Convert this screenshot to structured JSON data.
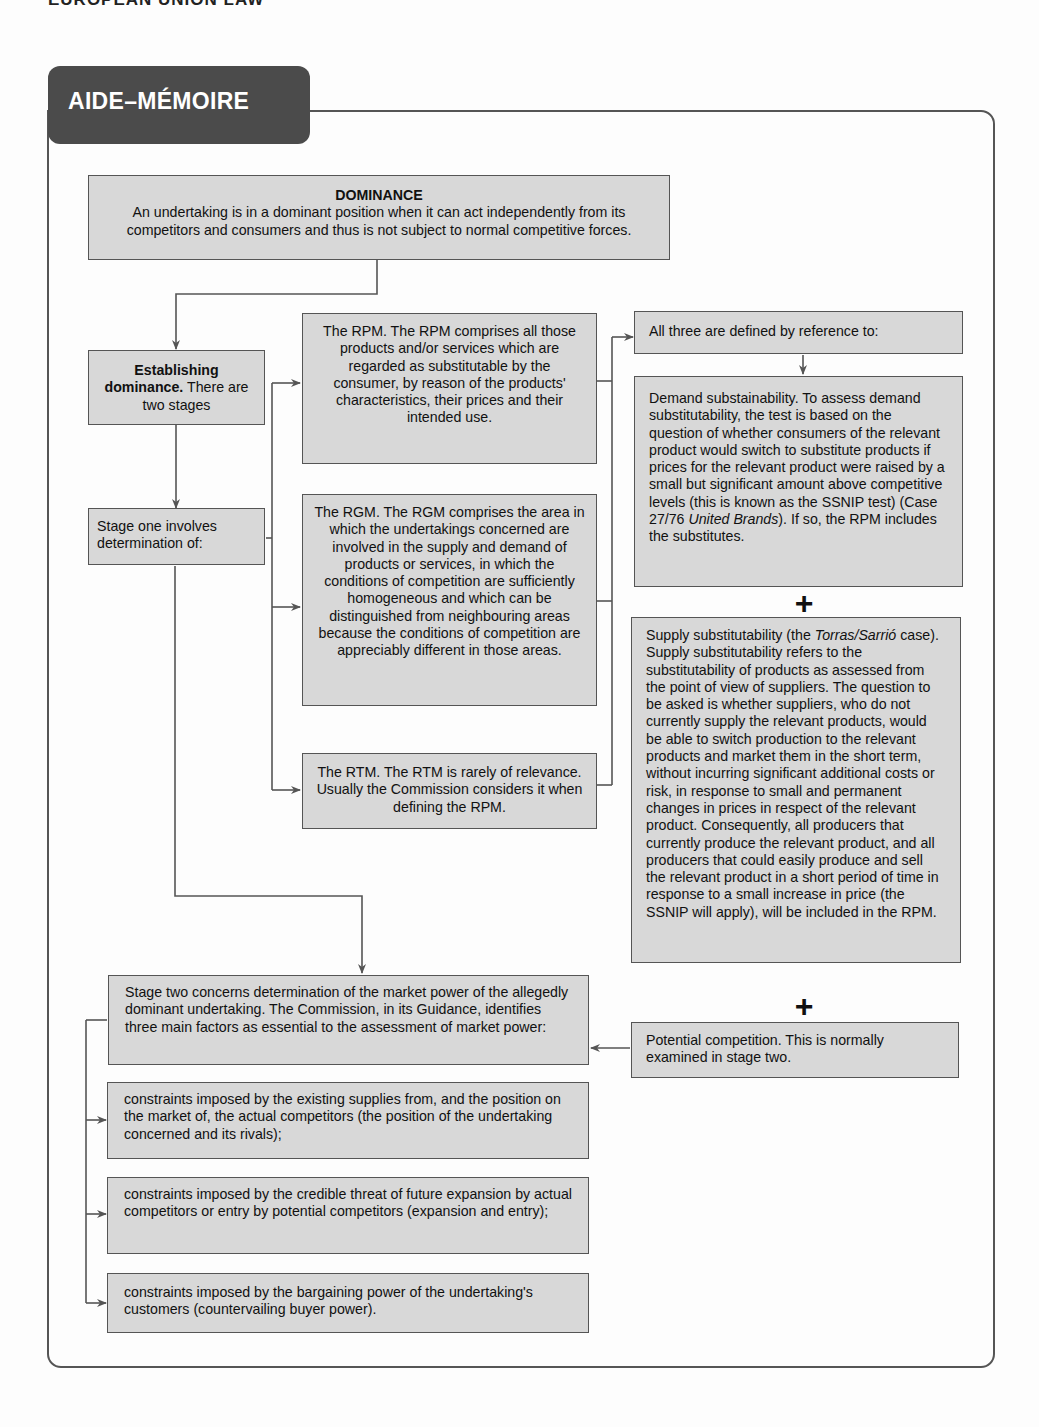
{
  "running_head": "EUROPEAN UNION LAW",
  "header": {
    "title": "AIDE–MÉMOIRE"
  },
  "dominance": {
    "title": "DOMINANCE",
    "text": "An undertaking is in a dominant position when it can act independently from its competitors and consumers and thus is not subject to normal competitive forces."
  },
  "establishing": {
    "bold": "Establishing dominance.",
    "text": " There are two stages"
  },
  "stage_one": {
    "text": "Stage one involves determination of:"
  },
  "rpm": {
    "text": "The RPM. The RPM comprises all those products and/or services which are regarded as substitutable by the consumer, by reason of the products' characteristics, their prices and their intended use."
  },
  "rgm": {
    "text": "The RGM. The RGM comprises the area in which the undertakings concerned are involved in the supply and demand of products or services, in which the conditions of competition are sufficiently homogeneous and which can be distinguished from neighbouring areas because the conditions of competition are appreciably different in those areas."
  },
  "rtm": {
    "text": "The RTM. The RTM is rarely of relevance. Usually the Commission considers it when defining the RPM."
  },
  "all_three": {
    "text": "All three are defined by reference to:"
  },
  "demand": {
    "text_before": "Demand substainability. To assess demand substitutability, the test is based on the question of whether consumers of the relevant product would switch to substitute products if prices for the relevant product were raised by a small but significant amount above competitive levels (this is known as the SSNIP test) (Case 27/76 ",
    "italic": "United Brands",
    "text_after": "). If so, the RPM includes the substitutes."
  },
  "supply": {
    "text_before": "Supply substitutability (the ",
    "italic": "Torras/Sarrió",
    "text_after": " case). Supply substitutability refers to the substitutability of products as assessed from the point of view of suppliers. The question to be asked is whether suppliers, who do not currently supply the relevant products, would be able to switch production to the relevant products and market them in the short term, without incurring significant additional costs or risk, in response to small and permanent changes in prices in respect of the relevant product. Consequently, all producers that currently produce the relevant product, and all producers that could easily produce and sell the relevant product in a short period of time in response to a small increase in price (the SSNIP will apply), will be included in the RPM."
  },
  "potential": {
    "text": "Potential competition. This is normally examined in stage two."
  },
  "plus_symbol": "+",
  "stage_two": {
    "text": "Stage two concerns determination of the market power of the allegedly dominant undertaking. The Commission, in its Guidance, identifies three main factors as essential to the assessment of market power:"
  },
  "factors": [
    {
      "text": "constraints imposed by the existing supplies from, and the position on the market of, the actual competitors (the position of the undertaking concerned and its rivals);"
    },
    {
      "text": "constraints imposed by the credible threat of future expansion by actual competitors or entry by potential competitors (expansion and entry);"
    },
    {
      "text": "constraints imposed by the bargaining power of the undertaking's customers (countervailing buyer power)."
    }
  ],
  "colors": {
    "box_fill": "#d8d8d8",
    "box_border": "#555555",
    "tab_fill": "#4b4b4b",
    "connector": "#555555"
  }
}
